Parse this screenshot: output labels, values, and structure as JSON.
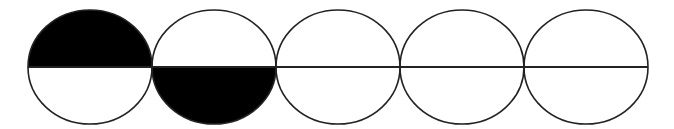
{
  "diagram": {
    "stroke_color": "#222222",
    "fill_color": "#000000",
    "background": "#ffffff",
    "baseline": {
      "x1": 28,
      "x2": 648,
      "y": 67
    },
    "circles": [
      {
        "cx": 90,
        "cy": 67,
        "rx": 62,
        "ry": 57,
        "shaded": "top"
      },
      {
        "cx": 214,
        "cy": 67,
        "rx": 62,
        "ry": 57,
        "shaded": "bottom"
      },
      {
        "cx": 338,
        "cy": 67,
        "rx": 62,
        "ry": 57,
        "shaded": "none"
      },
      {
        "cx": 462,
        "cy": 67,
        "rx": 62,
        "ry": 57,
        "shaded": "none"
      },
      {
        "cx": 586,
        "cy": 67,
        "rx": 62,
        "ry": 57,
        "shaded": "none"
      }
    ]
  }
}
